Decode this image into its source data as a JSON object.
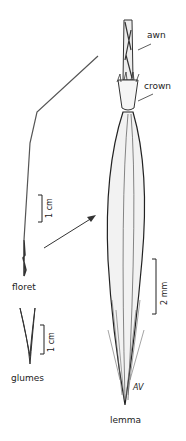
{
  "labels": {
    "awn": "awn",
    "crown": "crown",
    "floret": "floret",
    "glumes": "glumes",
    "lemma": "lemma"
  },
  "scales": {
    "floret_scale": "1 cm",
    "glumes_scale": "1 cm",
    "lemma_scale": "2 mm"
  },
  "signature": "AV"
}
